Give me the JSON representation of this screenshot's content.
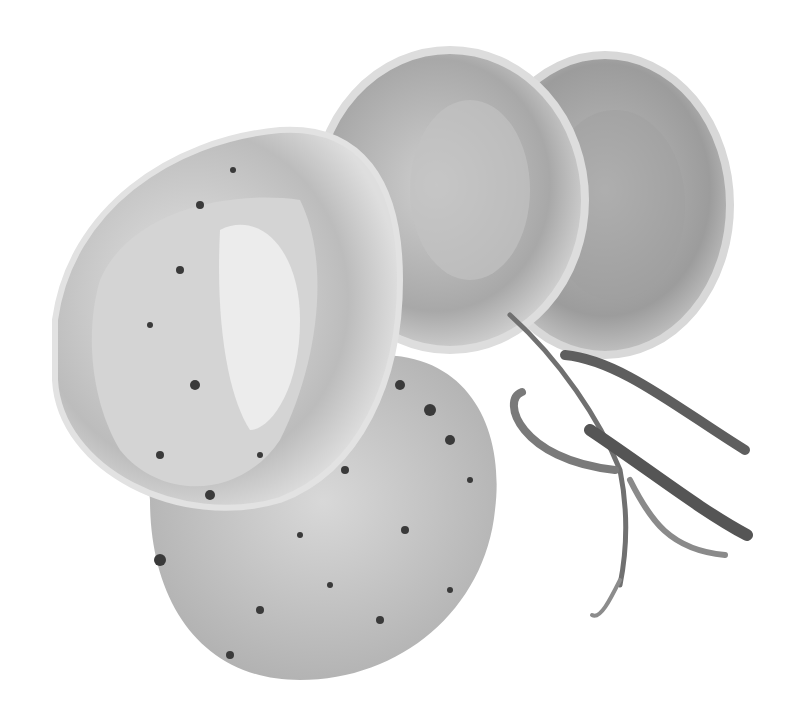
{
  "image": {
    "subject": "sliced rolled meat roulade with peppercorn cream sauce and tarragon sprig",
    "style": "grayscale product photo on white background",
    "colors": {
      "background": "#ffffff",
      "meat_light": "#d9d9d9",
      "meat_mid": "#b5b5b5",
      "meat_dark": "#8a8a8a",
      "sauce": "#c8c8c8",
      "peppercorn": "#3a3a3a",
      "herb": "#6e6e6e"
    }
  }
}
